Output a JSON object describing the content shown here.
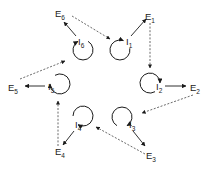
{
  "diagram": {
    "title": "",
    "colors": {
      "stroke": "#1a1a1a",
      "dashed": "#444444",
      "text": "#222222",
      "background": "#ffffff"
    },
    "internal_nodes": [
      {
        "id": "I1",
        "letter": "I",
        "sub": "1",
        "label_x": 126,
        "label_y": 45,
        "loop_cx": 120,
        "loop_cy": 50,
        "loop_r": 10,
        "arrow_angle": -70
      },
      {
        "id": "I2",
        "letter": "I",
        "sub": "2",
        "label_x": 156,
        "label_y": 90,
        "loop_cx": 150,
        "loop_cy": 83,
        "loop_r": 10,
        "arrow_angle": 0
      },
      {
        "id": "I3",
        "letter": "I",
        "sub": "3",
        "label_x": 129,
        "label_y": 128,
        "loop_cx": 122,
        "loop_cy": 117,
        "loop_r": 10,
        "arrow_angle": 60
      },
      {
        "id": "I4",
        "letter": "I",
        "sub": "4",
        "label_x": 75,
        "label_y": 128,
        "loop_cx": 83,
        "loop_cy": 116,
        "loop_r": 10,
        "arrow_angle": 120
      },
      {
        "id": "I5",
        "letter": "I",
        "sub": "5",
        "label_x": 48,
        "label_y": 90,
        "loop_cx": 60,
        "loop_cy": 84,
        "loop_r": 10,
        "arrow_angle": 180
      },
      {
        "id": "I6",
        "letter": "I",
        "sub": "6",
        "label_x": 78,
        "label_y": 45,
        "loop_cx": 83,
        "loop_cy": 50,
        "loop_r": 10,
        "arrow_angle": 240
      }
    ],
    "external_nodes": [
      {
        "id": "E1",
        "letter": "E",
        "sub": "1",
        "x": 145,
        "y": 20
      },
      {
        "id": "E2",
        "letter": "E",
        "sub": "2",
        "x": 190,
        "y": 91
      },
      {
        "id": "E3",
        "letter": "E",
        "sub": "3",
        "x": 146,
        "y": 159
      },
      {
        "id": "E4",
        "letter": "E",
        "sub": "4",
        "x": 55,
        "y": 155
      },
      {
        "id": "E5",
        "letter": "E",
        "sub": "5",
        "x": 8,
        "y": 91
      },
      {
        "id": "E6",
        "letter": "E",
        "sub": "6",
        "x": 55,
        "y": 17
      }
    ],
    "solid_edges": [
      {
        "from": "I1",
        "to": "E1",
        "x1": 131,
        "y1": 36,
        "x2": 146,
        "y2": 19
      },
      {
        "from": "I2",
        "to": "E2",
        "x1": 165,
        "y1": 86,
        "x2": 186,
        "y2": 86
      },
      {
        "from": "I3",
        "to": "E3",
        "x1": 133,
        "y1": 131,
        "x2": 145,
        "y2": 146
      },
      {
        "from": "I4",
        "to": "E4",
        "x1": 74,
        "y1": 131,
        "x2": 63,
        "y2": 145
      },
      {
        "from": "I5",
        "to": "E5",
        "x1": 45,
        "y1": 86,
        "x2": 25,
        "y2": 86
      },
      {
        "from": "I6",
        "to": "E6",
        "x1": 76,
        "y1": 36,
        "x2": 64,
        "y2": 22
      }
    ],
    "dashed_edges": [
      {
        "from": "E6",
        "to": "I1",
        "x1": 72,
        "y1": 16,
        "x2": 110,
        "y2": 39
      },
      {
        "from": "E1",
        "to": "I2",
        "x1": 150,
        "y1": 23,
        "x2": 150,
        "y2": 68
      },
      {
        "from": "E2",
        "to": "I3",
        "x1": 193,
        "y1": 95,
        "x2": 142,
        "y2": 113
      },
      {
        "from": "E3",
        "to": "I4",
        "x1": 145,
        "y1": 154,
        "x2": 96,
        "y2": 127
      },
      {
        "from": "E4",
        "to": "I5",
        "x1": 58,
        "y1": 146,
        "x2": 58,
        "y2": 101
      },
      {
        "from": "E5",
        "to": "I6",
        "x1": 20,
        "y1": 79,
        "x2": 65,
        "y2": 61
      }
    ]
  }
}
